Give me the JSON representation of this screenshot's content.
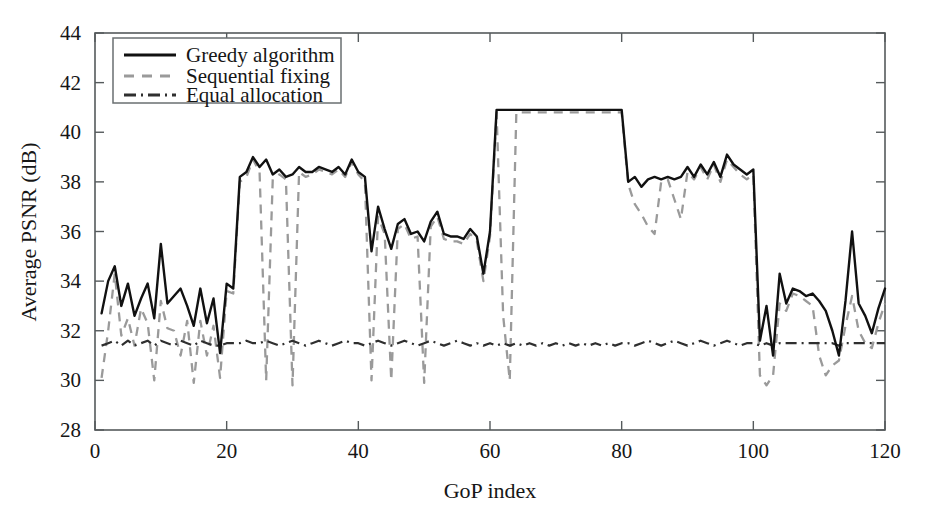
{
  "chart_data": {
    "type": "line",
    "title": "",
    "xlabel": "GoP index",
    "ylabel": "Average PSNR (dB)",
    "xlim": [
      0,
      120
    ],
    "ylim": [
      28,
      44
    ],
    "xticks": [
      0,
      20,
      40,
      60,
      80,
      100,
      120
    ],
    "yticks": [
      28,
      30,
      32,
      34,
      36,
      38,
      40,
      42,
      44
    ],
    "grid": false,
    "legend_position": "upper-left",
    "colors": {
      "greedy": "#111111",
      "sequential": "#9a9a9a",
      "equal": "#2f2f2f",
      "axis": "#555a5c",
      "background": "#ffffff"
    },
    "legend": [
      {
        "label": "Greedy algorithm",
        "style": "solid",
        "color": "#111111"
      },
      {
        "label": "Sequential fixing",
        "style": "dashed",
        "color": "#9a9a9a"
      },
      {
        "label": "Equal allocation",
        "style": "dash-dot",
        "color": "#2f2f2f"
      }
    ],
    "x": [
      1,
      2,
      3,
      4,
      5,
      6,
      7,
      8,
      9,
      10,
      11,
      12,
      13,
      14,
      15,
      16,
      17,
      18,
      19,
      20,
      21,
      22,
      23,
      24,
      25,
      26,
      27,
      28,
      29,
      30,
      31,
      32,
      33,
      34,
      35,
      36,
      37,
      38,
      39,
      40,
      41,
      42,
      43,
      44,
      45,
      46,
      47,
      48,
      49,
      50,
      51,
      52,
      53,
      54,
      55,
      56,
      57,
      58,
      59,
      60,
      61,
      62,
      63,
      64,
      65,
      66,
      67,
      68,
      69,
      70,
      71,
      72,
      73,
      74,
      75,
      76,
      77,
      78,
      79,
      80,
      81,
      82,
      83,
      84,
      85,
      86,
      87,
      88,
      89,
      90,
      91,
      92,
      93,
      94,
      95,
      96,
      97,
      98,
      99,
      100,
      101,
      102,
      103,
      104,
      105,
      106,
      107,
      108,
      109,
      110,
      111,
      112,
      113,
      114,
      115,
      116,
      117,
      118,
      119,
      120
    ],
    "series": [
      {
        "name": "Greedy algorithm",
        "style": "solid",
        "values": [
          32.7,
          34.0,
          34.6,
          33.0,
          33.9,
          32.6,
          33.3,
          33.9,
          32.5,
          35.5,
          33.1,
          33.4,
          33.7,
          33.0,
          32.2,
          33.7,
          32.3,
          33.3,
          31.1,
          33.9,
          33.7,
          38.2,
          38.4,
          39.0,
          38.6,
          38.9,
          38.3,
          38.5,
          38.2,
          38.3,
          38.6,
          38.4,
          38.4,
          38.6,
          38.5,
          38.4,
          38.6,
          38.3,
          38.9,
          38.4,
          38.2,
          35.2,
          37.0,
          36.1,
          35.3,
          36.3,
          36.5,
          35.9,
          36.0,
          35.6,
          36.4,
          36.8,
          35.9,
          35.8,
          35.8,
          35.7,
          36.1,
          35.8,
          34.3,
          36.0,
          40.9,
          40.9,
          40.9,
          40.9,
          40.9,
          40.9,
          40.9,
          40.9,
          40.9,
          40.9,
          40.9,
          40.9,
          40.9,
          40.9,
          40.9,
          40.9,
          40.9,
          40.9,
          40.9,
          40.9,
          38.0,
          38.2,
          37.8,
          38.1,
          38.2,
          38.1,
          38.2,
          38.1,
          38.2,
          38.6,
          38.2,
          38.7,
          38.3,
          38.8,
          38.2,
          39.1,
          38.7,
          38.5,
          38.3,
          38.5,
          31.6,
          33.0,
          31.0,
          34.3,
          33.1,
          33.7,
          33.6,
          33.4,
          33.5,
          33.2,
          32.8,
          32.0,
          31.0,
          33.2,
          36.0,
          33.1,
          32.6,
          31.9,
          32.9,
          33.7
        ]
      },
      {
        "name": "Sequential fixing",
        "style": "dashed",
        "values": [
          30.1,
          32.0,
          34.3,
          31.8,
          32.5,
          31.4,
          32.9,
          32.3,
          30.0,
          33.2,
          32.1,
          32.0,
          31.0,
          32.4,
          29.9,
          32.4,
          31.0,
          32.2,
          30.1,
          33.6,
          33.5,
          38.0,
          38.2,
          38.9,
          38.4,
          30.0,
          38.1,
          38.3,
          38.1,
          29.8,
          38.4,
          38.2,
          38.3,
          38.5,
          38.4,
          38.3,
          38.5,
          38.2,
          38.8,
          38.3,
          38.0,
          30.0,
          36.6,
          35.9,
          30.0,
          36.1,
          36.3,
          35.7,
          35.8,
          29.9,
          36.2,
          36.6,
          35.7,
          35.6,
          35.6,
          35.5,
          35.9,
          35.6,
          34.0,
          35.8,
          40.8,
          32.6,
          30.0,
          40.8,
          40.8,
          40.8,
          40.8,
          40.8,
          40.8,
          40.8,
          40.8,
          40.8,
          40.8,
          40.8,
          40.8,
          40.8,
          40.8,
          40.8,
          40.8,
          40.8,
          37.9,
          37.1,
          36.7,
          36.2,
          35.9,
          38.0,
          38.1,
          37.3,
          36.5,
          38.4,
          38.1,
          38.6,
          38.1,
          38.7,
          38.0,
          38.9,
          38.6,
          38.3,
          38.1,
          38.3,
          30.2,
          29.8,
          30.2,
          33.1,
          32.8,
          33.5,
          33.4,
          33.2,
          33.0,
          31.0,
          30.2,
          30.6,
          30.8,
          32.2,
          33.4,
          32.0,
          31.5,
          31.3,
          32.3,
          33.1
        ]
      },
      {
        "name": "Equal allocation",
        "style": "dash-dot",
        "values": [
          31.4,
          31.5,
          31.6,
          31.4,
          31.6,
          31.4,
          31.5,
          31.6,
          31.4,
          31.6,
          31.5,
          31.4,
          31.6,
          31.5,
          31.4,
          31.6,
          31.5,
          31.4,
          31.4,
          31.5,
          31.5,
          31.5,
          31.6,
          31.5,
          31.5,
          31.6,
          31.5,
          31.4,
          31.5,
          31.6,
          31.5,
          31.4,
          31.5,
          31.6,
          31.5,
          31.4,
          31.5,
          31.6,
          31.5,
          31.5,
          31.4,
          31.5,
          31.6,
          31.5,
          31.4,
          31.5,
          31.6,
          31.5,
          31.4,
          31.5,
          31.6,
          31.5,
          31.4,
          31.5,
          31.6,
          31.5,
          31.4,
          31.5,
          31.4,
          31.5,
          31.4,
          31.5,
          31.4,
          31.5,
          31.4,
          31.5,
          31.4,
          31.5,
          31.4,
          31.5,
          31.4,
          31.5,
          31.4,
          31.5,
          31.4,
          31.5,
          31.4,
          31.5,
          31.4,
          31.5,
          31.5,
          31.4,
          31.5,
          31.6,
          31.5,
          31.4,
          31.5,
          31.6,
          31.5,
          31.4,
          31.5,
          31.6,
          31.5,
          31.4,
          31.5,
          31.6,
          31.5,
          31.4,
          31.5,
          31.5,
          31.4,
          31.5,
          31.4,
          31.5,
          31.5,
          31.5,
          31.5,
          31.5,
          31.5,
          31.5,
          31.5,
          31.5,
          31.4,
          31.5,
          31.5,
          31.5,
          31.5,
          31.5,
          31.5,
          31.5
        ]
      }
    ]
  }
}
